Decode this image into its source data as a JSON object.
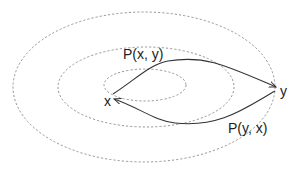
{
  "diagram": {
    "nodes": [
      {
        "id": "x",
        "label": "x"
      },
      {
        "id": "y",
        "label": "y"
      }
    ],
    "edges": [
      {
        "from": "x",
        "to": "y",
        "label": "P(x, y)"
      },
      {
        "from": "y",
        "to": "x",
        "label": "P(y, x)"
      }
    ],
    "ellipses": [
      "inner",
      "middle",
      "outer"
    ],
    "colors": {
      "ellipse_stroke": "#8a8a8a",
      "path_stroke": "#333333",
      "text": "#222222"
    }
  }
}
